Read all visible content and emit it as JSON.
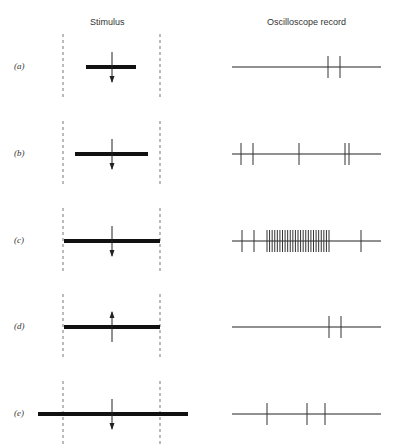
{
  "headers": {
    "stimulus": "Stimulus",
    "record": "Oscilloscope record"
  },
  "rows": [
    {
      "label": "(a)",
      "y": 67,
      "bar": [
        86,
        136
      ],
      "arrow": "down",
      "spikes": [
        328,
        340
      ]
    },
    {
      "label": "(b)",
      "y": 154,
      "bar": [
        75,
        148
      ],
      "arrow": "down",
      "spikes": [
        241,
        253,
        299,
        345,
        349
      ]
    },
    {
      "label": "(c)",
      "y": 241,
      "bar": [
        64,
        160
      ],
      "arrow": "down",
      "spikes": [
        242,
        254,
        361
      ],
      "burst": {
        "start": 267,
        "end": 329,
        "count": 25
      }
    },
    {
      "label": "(d)",
      "y": 327,
      "bar": [
        64,
        160
      ],
      "arrow": "up",
      "spikes": [
        329,
        341
      ]
    },
    {
      "label": "(e)",
      "y": 414,
      "bar": [
        38,
        188
      ],
      "arrow": "down",
      "spikes": [
        267,
        307,
        325
      ]
    }
  ],
  "layout": {
    "dash_left": 63,
    "dash_right": 160,
    "arrow_x": 112,
    "record_start": 232,
    "record_end": 381
  }
}
